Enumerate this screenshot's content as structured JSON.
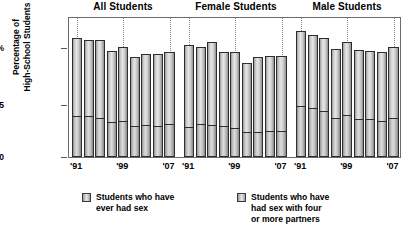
{
  "chart_data": {
    "type": "bar",
    "title": "",
    "subtitle": "",
    "xlabel": "",
    "ylabel": "Percentage of High-School Students",
    "ylim": [
      0,
      60
    ],
    "yticks": [
      0,
      25,
      50
    ],
    "ytick_labels": [
      "0",
      "25",
      "50%"
    ],
    "grid": "dotted vertical gridlines at '91, '99, '07",
    "legend_position": "bottom",
    "stacked": true,
    "panels": [
      {
        "title": "All Students",
        "x": [
          "'91",
          "'93",
          "'95",
          "'97",
          "'99",
          "'01",
          "'03",
          "'05",
          "'07"
        ],
        "xtick_labels_shown": [
          "'91",
          "'99",
          "'07"
        ],
        "series": [
          {
            "name": "Students who have ever had sex",
            "values": [
              54.1,
              53.0,
              53.1,
              48.4,
              49.9,
              45.6,
              46.7,
              46.8,
              47.8
            ]
          },
          {
            "name": "Students who have had sex with four or more partners",
            "values": [
              18.7,
              18.7,
              17.8,
              16.0,
              16.2,
              14.2,
              14.4,
              14.3,
              14.9
            ]
          }
        ]
      },
      {
        "title": "Female Students",
        "x": [
          "'91",
          "'93",
          "'95",
          "'97",
          "'99",
          "'01",
          "'03",
          "'05",
          "'07"
        ],
        "xtick_labels_shown": [
          "'91",
          "'99",
          "'07"
        ],
        "series": [
          {
            "name": "Students who have ever had sex",
            "values": [
              50.8,
              50.2,
              52.1,
              47.7,
              47.7,
              42.9,
              45.3,
              45.7,
              45.9
            ]
          },
          {
            "name": "Students who have had sex with four or more partners",
            "values": [
              13.8,
              15.0,
              14.4,
              14.1,
              13.1,
              11.4,
              11.2,
              12.0,
              11.8
            ]
          }
        ]
      },
      {
        "title": "Male Students",
        "x": [
          "'91",
          "'93",
          "'95",
          "'97",
          "'99",
          "'01",
          "'03",
          "'05",
          "'07"
        ],
        "xtick_labels_shown": [
          "'91",
          "'99",
          "'07"
        ],
        "series": [
          {
            "name": "Students who have ever had sex",
            "values": [
              57.4,
              55.6,
              54.0,
              48.9,
              52.2,
              48.5,
              48.0,
              47.9,
              49.8
            ]
          },
          {
            "name": "Students who have had sex with four or more partners",
            "values": [
              23.4,
              22.3,
              20.9,
              17.6,
              19.3,
              17.2,
              17.5,
              16.5,
              17.9
            ]
          }
        ]
      }
    ],
    "legend": [
      {
        "label_lines": [
          "Students who have",
          "ever had sex"
        ],
        "color": "#d8d8d8"
      },
      {
        "label_lines": [
          "Students who have",
          "had sex with four",
          "or more partners"
        ],
        "color": "#d8d8d8"
      }
    ]
  },
  "axis": {
    "ylabel_line1": "Percentage of",
    "ylabel_line2": "High-School Students",
    "ytick_0": "0",
    "ytick_25": "25",
    "ytick_50": "50%"
  }
}
